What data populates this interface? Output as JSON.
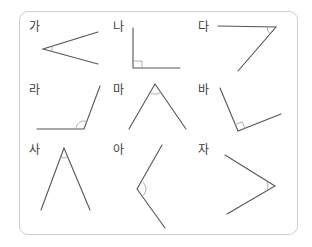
{
  "figure": {
    "colors": {
      "border": "#cfcfcf",
      "line": "#555555",
      "mark": "#9a9a9a",
      "label": "#3c3c3c"
    }
  },
  "angles": [
    {
      "label": "가",
      "type": "acute",
      "vertex": [
        43,
        49
      ],
      "ends": [
        [
          98,
          32
        ],
        [
          98,
          64
        ]
      ],
      "mark": "arc"
    },
    {
      "label": "나",
      "type": "right",
      "vertex": [
        133,
        68
      ],
      "ends": [
        [
          133,
          28
        ],
        [
          180,
          68
        ]
      ],
      "mark": "square"
    },
    {
      "label": "다",
      "type": "acute",
      "vertex": [
        276,
        27
      ],
      "ends": [
        [
          218,
          26
        ],
        [
          238,
          71
        ]
      ],
      "mark": "arc"
    },
    {
      "label": "라",
      "type": "obtuse",
      "vertex": [
        84,
        129
      ],
      "ends": [
        [
          37,
          129
        ],
        [
          100,
          86
        ]
      ],
      "mark": "arc"
    },
    {
      "label": "마",
      "type": "acute",
      "vertex": [
        155,
        84
      ],
      "ends": [
        [
          129,
          129
        ],
        [
          186,
          129
        ]
      ],
      "mark": "arc"
    },
    {
      "label": "바",
      "type": "right",
      "vertex": [
        238,
        131
      ],
      "ends": [
        [
          220,
          88
        ],
        [
          281,
          114
        ]
      ],
      "mark": "square"
    },
    {
      "label": "사",
      "type": "acute",
      "vertex": [
        64,
        148
      ],
      "ends": [
        [
          41,
          210
        ],
        [
          90,
          210
        ]
      ],
      "mark": "arc"
    },
    {
      "label": "아",
      "type": "obtuse",
      "vertex": [
        137,
        189
      ],
      "ends": [
        [
          162,
          145
        ],
        [
          165,
          228
        ]
      ],
      "mark": "arc"
    },
    {
      "label": "자",
      "type": "acute",
      "vertex": [
        275,
        186
      ],
      "ends": [
        [
          225,
          155
        ],
        [
          227,
          214
        ]
      ],
      "mark": "arc"
    }
  ]
}
